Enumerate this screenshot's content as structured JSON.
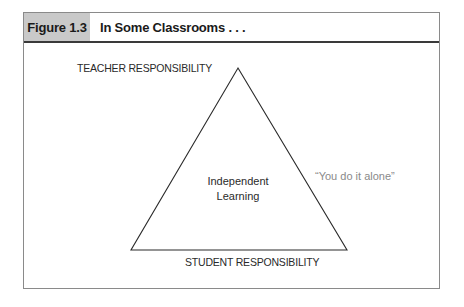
{
  "figure": {
    "label": "Figure 1.3",
    "title": "In Some Classrooms . . ."
  },
  "diagram": {
    "top_label": "TEACHER RESPONSIBILITY",
    "bottom_label": "STUDENT RESPONSIBILITY",
    "center_line1": "Independent",
    "center_line2": "Learning",
    "side_quote": "“You do it alone”",
    "shape": "triangle",
    "colors": {
      "header_label_bg": "#c9c9c9",
      "stroke": "#2a2a2a",
      "quote_text": "#8a8a8a"
    }
  }
}
